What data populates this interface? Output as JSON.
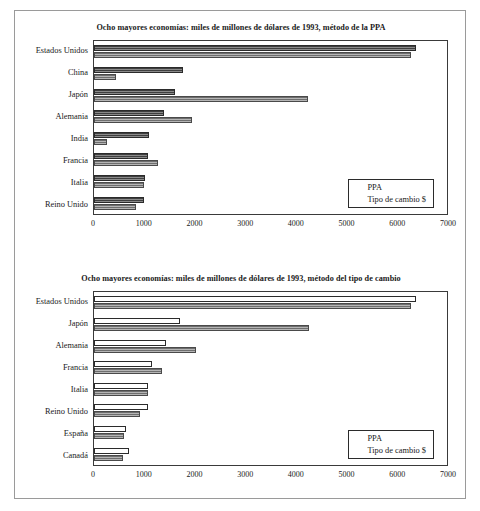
{
  "chart_data": [
    {
      "type": "bar",
      "orientation": "horizontal",
      "title": "Ocho mayores economías: miles de millones de dólares de 1993, método de la PPA",
      "xlabel": "",
      "ylabel": "",
      "xlim": [
        0,
        7000
      ],
      "xticks": [
        0,
        1000,
        2000,
        3000,
        4000,
        5000,
        6000,
        7000
      ],
      "xtick_labels": [
        "0",
        "1000",
        "2000",
        "3000",
        "4000",
        "5000",
        "6000",
        "7000"
      ],
      "grid": false,
      "legend_position": "bottom-right",
      "categories": [
        "Estados Unidos",
        "China",
        "Japón",
        "Alemania",
        "India",
        "Francia",
        "Italia",
        "Reino Unido"
      ],
      "series": [
        {
          "name": "PPA",
          "style": "dark-hatched",
          "values": [
            6380,
            1770,
            1600,
            1390,
            1100,
            1080,
            1010,
            1000
          ]
        },
        {
          "name": "Tipo de cambio $",
          "style": "gray-hatched",
          "values": [
            6280,
            440,
            4250,
            1940,
            250,
            1270,
            990,
            830
          ]
        }
      ]
    },
    {
      "type": "bar",
      "orientation": "horizontal",
      "title": "Ocho mayores economías: miles de millones de dólares de 1993, método del tipo de cambio",
      "xlabel": "",
      "ylabel": "",
      "xlim": [
        0,
        7000
      ],
      "xticks": [
        0,
        1000,
        2000,
        3000,
        4000,
        5000,
        6000,
        7000
      ],
      "xtick_labels": [
        "0",
        "1000",
        "2000",
        "3000",
        "4000",
        "5000",
        "6000",
        "7000"
      ],
      "grid": false,
      "legend_position": "bottom-right",
      "categories": [
        "Estados Unidos",
        "Japón",
        "Alemania",
        "Francia",
        "Italia",
        "Reino Unido",
        "España",
        "Canadá"
      ],
      "series": [
        {
          "name": "PPA",
          "style": "white",
          "values": [
            6380,
            1700,
            1430,
            1160,
            1080,
            1080,
            630,
            690
          ]
        },
        {
          "name": "Tipo de cambio $",
          "style": "gray-hatched",
          "values": [
            6280,
            4260,
            2020,
            1340,
            1080,
            910,
            590,
            570
          ]
        }
      ]
    }
  ]
}
